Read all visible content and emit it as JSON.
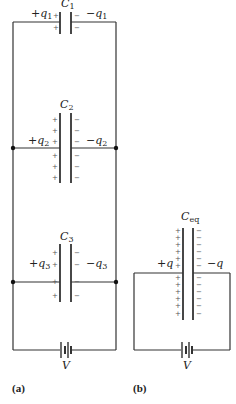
{
  "figure": {
    "panels": [
      {
        "id": "a",
        "label": "(a)",
        "description": "Three capacitors connected in parallel across a battery",
        "capacitors": [
          {
            "name": "C",
            "sub": "1",
            "left_charge": "+q",
            "left_sub": "1",
            "right_charge": "−q",
            "right_sub": "1",
            "plus_count": 2,
            "minus_count": 2
          },
          {
            "name": "C",
            "sub": "2",
            "left_charge": "+q",
            "left_sub": "2",
            "right_charge": "−q",
            "right_sub": "2",
            "plus_count": 6,
            "minus_count": 6
          },
          {
            "name": "C",
            "sub": "3",
            "left_charge": "+q",
            "left_sub": "3",
            "right_charge": "−q",
            "right_sub": "3",
            "plus_count": 4,
            "minus_count": 4
          }
        ],
        "battery_label": "V"
      },
      {
        "id": "b",
        "label": "(b)",
        "description": "Equivalent capacitor connected across the same battery",
        "capacitor": {
          "name": "C",
          "sub": "eq",
          "left_charge": "+q",
          "right_charge": "−q",
          "plus_count": 12,
          "minus_count": 12
        },
        "battery_label": "V"
      }
    ],
    "colors": {
      "line": "#333333",
      "text": "#222222",
      "sign": "#555555",
      "background": "#ffffff"
    }
  }
}
